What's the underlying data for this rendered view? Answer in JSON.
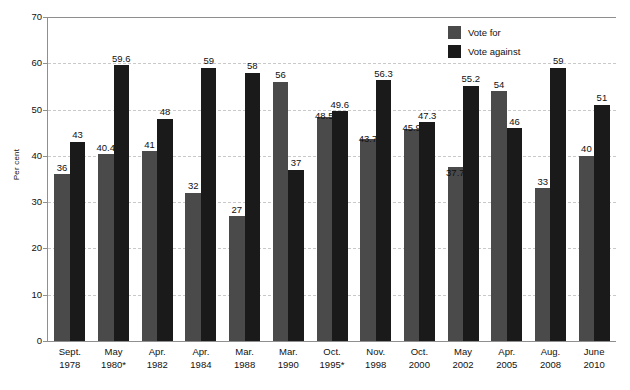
{
  "chart_data": {
    "type": "bar",
    "title": "",
    "subtitle": "",
    "xlabel": "",
    "ylabel": "Per cent",
    "ylim": [
      0,
      70
    ],
    "yticks": [
      0,
      10,
      20,
      30,
      40,
      50,
      60,
      70
    ],
    "ytick_labels": [
      "0",
      "10",
      "20",
      "30",
      "40",
      "50",
      "60",
      "70"
    ],
    "grid": true,
    "grid_style": "dashed horizontal gridlines",
    "legend_position": "top-right inside plot area",
    "categories": [
      "Sept. 1978",
      "May 1980*",
      "Apr. 1982",
      "Apr. 1984",
      "Mar. 1988",
      "Mar. 1990",
      "Oct. 1995*",
      "Nov. 1998",
      "Oct. 2000",
      "May 2002",
      "Apr. 2005",
      "Aug. 2008",
      "June 2010"
    ],
    "category_lines": [
      {
        "line1": "Sept.",
        "line2": "1978"
      },
      {
        "line1": "May",
        "line2": "1980*"
      },
      {
        "line1": "Apr.",
        "line2": "1982"
      },
      {
        "line1": "Apr.",
        "line2": "1984"
      },
      {
        "line1": "Mar.",
        "line2": "1988"
      },
      {
        "line1": "Mar.",
        "line2": "1990"
      },
      {
        "line1": "Oct.",
        "line2": "1995*"
      },
      {
        "line1": "Nov.",
        "line2": "1998"
      },
      {
        "line1": "Oct.",
        "line2": "2000"
      },
      {
        "line1": "May",
        "line2": "2002"
      },
      {
        "line1": "Apr.",
        "line2": "2005"
      },
      {
        "line1": "Aug.",
        "line2": "2008"
      },
      {
        "line1": "June",
        "line2": "2010"
      }
    ],
    "series": [
      {
        "name": "Vote for",
        "color": "#4a4a4a",
        "values": [
          36,
          40.4,
          41,
          32,
          27,
          56,
          48.5,
          43.7,
          45.9,
          37.7,
          54,
          33,
          40
        ],
        "labels": [
          "36",
          "40.4",
          "41",
          "32",
          "27",
          "56",
          "48.5",
          "43.7",
          "45.9",
          "37.7",
          "54",
          "33",
          "40"
        ]
      },
      {
        "name": "Vote against",
        "color": "#1a1a1a",
        "values": [
          43,
          59.6,
          48,
          59,
          58,
          37,
          49.6,
          56.3,
          47.3,
          55.2,
          46,
          59,
          51
        ],
        "labels": [
          "43",
          "59.6",
          "48",
          "59",
          "58",
          "37",
          "49.6",
          "56.3",
          "47.3",
          "55.2",
          "46",
          "59",
          "51"
        ]
      }
    ]
  },
  "legend": {
    "items": [
      {
        "label": "Vote for",
        "color": "#4a4a4a"
      },
      {
        "label": "Vote against",
        "color": "#1a1a1a"
      }
    ]
  },
  "axes": {
    "y_title": "Per cent"
  }
}
